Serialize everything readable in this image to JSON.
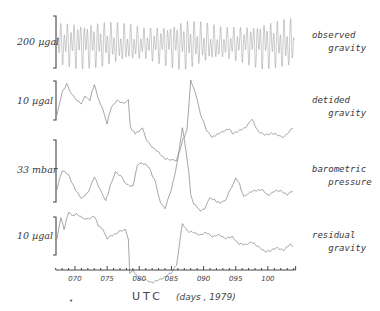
{
  "chart_data": {
    "type": "line",
    "title": "",
    "xlabel": "UTC (days, 1979)",
    "xlabel_parts": {
      "main": "UTC",
      "detail": "(days , 1979)"
    },
    "xlim": [
      67,
      104
    ],
    "xticks": [
      "070",
      "075",
      "080",
      "085",
      "090",
      "095",
      "100"
    ],
    "xtick_values": [
      70,
      75,
      80,
      85,
      90,
      95,
      100
    ],
    "minor_tick_step": 1,
    "legend_position": "right",
    "grid": false,
    "panels": [
      {
        "name": "observed gravity",
        "label_line1": "observed",
        "label_line2": "gravity",
        "scale_label": "200 µgal",
        "scale_bar": 200,
        "unit": "µgal",
        "style": "tidal",
        "note": "Semi-diurnal/diurnal tidal oscillation, peak-to-peak ~200 µgal, amplitude envelope max near days 070–074, ~086–088 and ~098–103, minima near ~080 and ~093",
        "envelope_days": [
          67,
          70,
          74,
          78,
          81,
          84,
          87,
          90,
          93,
          96,
          99,
          103
        ],
        "envelope_amp": [
          0.8,
          0.92,
          0.9,
          0.75,
          0.62,
          0.8,
          1.0,
          0.82,
          0.62,
          0.72,
          0.92,
          0.96
        ]
      },
      {
        "name": "detided gravity",
        "label_line1": "detided",
        "label_line2": "gravity",
        "scale_label": "10 µgal",
        "scale_bar": 10,
        "unit": "µgal",
        "days": [
          67.2,
          68,
          68.7,
          69.5,
          70.3,
          71,
          71.5,
          72.3,
          73,
          73.6,
          74.2,
          75,
          75.6,
          76.5,
          77.5,
          78.3,
          78.6,
          79.3,
          80,
          80.5,
          81,
          82,
          83,
          84,
          85,
          85.8,
          86.3,
          86.8,
          87.4,
          88,
          88.7,
          89.5,
          90.5,
          91.3,
          92,
          93,
          94,
          94.5,
          95.5,
          96.5,
          97.5,
          98.5,
          99.5,
          100.5,
          101.5,
          102.5,
          103.3,
          104
        ],
        "values": [
          -4.0,
          2.0,
          4.0,
          1.5,
          0.0,
          -1.0,
          1.0,
          0.0,
          4.0,
          0.5,
          -2.0,
          -6.0,
          -2.0,
          0.0,
          -1.0,
          0.0,
          -7.0,
          -8.5,
          -8.0,
          -7.0,
          -10.0,
          -12.0,
          -13.5,
          -15.0,
          -15.5,
          -15.5,
          -13.0,
          -10.0,
          -8.0,
          5.0,
          2.0,
          -3.5,
          -8.0,
          -9.5,
          -9.0,
          -8.0,
          -7.5,
          -8.5,
          -8.0,
          -7.0,
          -5.0,
          -8.0,
          -9.0,
          -8.5,
          -9.0,
          -9.5,
          -8.0,
          -7.0
        ]
      },
      {
        "name": "barometric pressure",
        "label_line1": "barometric",
        "label_line2": "pressure",
        "scale_label": "33  mbar",
        "scale_bar": 33,
        "unit": "mbar",
        "days": [
          67.2,
          68,
          69,
          70,
          71,
          72,
          73,
          74,
          74.8,
          75.5,
          76.3,
          77.2,
          78,
          79,
          79.7,
          80.5,
          81.5,
          82.5,
          83.3,
          84,
          85,
          86,
          86.7,
          87.3,
          87.7,
          88,
          88.5,
          89,
          89.5,
          90.2,
          91,
          91.8,
          92.5,
          93.3,
          94.2,
          95,
          95.6,
          96.2,
          97,
          98,
          99,
          100,
          101,
          102,
          103,
          104
        ],
        "values": [
          -4.0,
          6.0,
          4.0,
          -4.0,
          -8.5,
          -6.0,
          3.0,
          -5.0,
          -10.0,
          -2.0,
          5.5,
          3.0,
          -1.0,
          -2.5,
          9.0,
          10.0,
          8.0,
          0.0,
          -11.0,
          -14.0,
          -4.0,
          12.0,
          29.0,
          16.0,
          5.0,
          -7.0,
          -12.0,
          -13.0,
          -15.5,
          -14.0,
          -8.0,
          -10.0,
          -11.0,
          -10.5,
          -4.0,
          2.0,
          -1.0,
          -8.0,
          -6.0,
          -4.5,
          -4.0,
          -7.0,
          -5.0,
          -4.5,
          -7.0,
          -4.0
        ]
      },
      {
        "name": "residual gravity",
        "label_line1": "residual",
        "label_line2": "gravity",
        "scale_label": "10  µgal",
        "scale_bar": 10,
        "unit": "µgal",
        "days": [
          67.2,
          67.8,
          68.3,
          69,
          69.6,
          70.3,
          71.2,
          72,
          73,
          73.6,
          74.3,
          75,
          76,
          77,
          77.8,
          78.3,
          78.5,
          79,
          80,
          81,
          82,
          83,
          84,
          85,
          85.8,
          86.2,
          86.7,
          87.5,
          88.5,
          89.5,
          90.5,
          91.5,
          92.5,
          93.5,
          94.5,
          95.5,
          96.5,
          97.5,
          98.5,
          99.5,
          100.5,
          101.5,
          102.5,
          103.5,
          104
        ],
        "values": [
          -2.0,
          3.5,
          0.5,
          5.0,
          4.0,
          4.5,
          3.5,
          3.0,
          4.0,
          1.5,
          0.5,
          -2.0,
          -1.0,
          0.0,
          0.5,
          -2.0,
          -11.0,
          -10.5,
          -12.5,
          -13.0,
          -13.5,
          -13.0,
          -12.0,
          -11.0,
          -9.0,
          -4.0,
          2.0,
          0.0,
          -0.5,
          -1.0,
          -0.5,
          -1.5,
          -1.0,
          -2.0,
          -1.5,
          -3.5,
          -3.5,
          -3.0,
          -4.0,
          -5.5,
          -5.0,
          -4.5,
          -5.0,
          -3.5,
          -4.0
        ]
      }
    ]
  },
  "labels": {
    "panel1_scale": "200  µgal",
    "panel2_scale": "10  µgal",
    "panel3_scale": "33  mbar",
    "panel4_scale": "10  µgal",
    "panel1_name": "observed\n   gravity",
    "panel2_name": "detided\n   gravity",
    "panel3_name": "barometric\n   pressure",
    "panel4_name": "residual\n   gravity",
    "axis_main": "UTC",
    "axis_detail": "(days , 1979)",
    "footnote_mark": "•"
  },
  "colors": {
    "ink": "#555555",
    "axis": "#333333",
    "trace": "#6a6a6a"
  }
}
